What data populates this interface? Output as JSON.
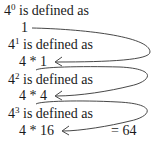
{
  "steps": [
    {
      "base": "4",
      "exponent": "0",
      "label": " is defined as",
      "expression": "1"
    },
    {
      "base": "4",
      "exponent": "1",
      "label": " is defined as",
      "expression": "4 * 1"
    },
    {
      "base": "4",
      "exponent": "2",
      "label": " is defined as",
      "expression": "4 * 4"
    },
    {
      "base": "4",
      "exponent": "3",
      "label": " is defined as",
      "expression": "4 * 16"
    }
  ],
  "result": "= 64"
}
